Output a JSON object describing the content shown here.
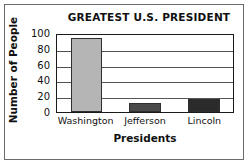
{
  "chart_data": {
    "type": "bar",
    "title": "GREATEST U.S. PRESIDENT",
    "xlabel": "Presidents",
    "ylabel": "Number of People",
    "categories": [
      "Washington",
      "Jefferson",
      "Lincoln"
    ],
    "values": [
      94,
      11,
      16
    ],
    "series": [
      {
        "name": "Number of People",
        "values": [
          94,
          11,
          16
        ]
      }
    ],
    "ylim": [
      0,
      100
    ],
    "yticks": [
      100,
      80,
      60,
      40,
      20,
      0
    ],
    "ytick_labels": [
      "100",
      "80",
      "60",
      "40",
      "20",
      "0"
    ],
    "grid": true,
    "grid_axis": "y",
    "legend": false,
    "bar_colors": [
      "#b5b5b5",
      "#4a4a4a",
      "#2b2b2b"
    ],
    "frame_color": "#1a1a1a",
    "background": "#ffffff",
    "text_color": "#111111"
  }
}
